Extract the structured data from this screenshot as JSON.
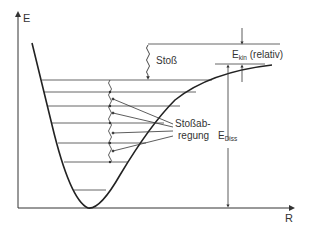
{
  "diagram": {
    "axes": {
      "y_label": "E",
      "x_label": "R"
    },
    "labels": {
      "collision": "Stoß",
      "ekin_main": "E",
      "ekin_sub": "kin",
      "ekin_suffix": " (relativ)",
      "collision_excitation_line1": "Stoßab-",
      "collision_excitation_line2": "regung",
      "ediss_main": "E",
      "ediss_sub": "Diss"
    },
    "vibrational_levels_count": 7,
    "colors": {
      "line": "#333333",
      "curve": "#222222",
      "level": "#555555"
    }
  }
}
